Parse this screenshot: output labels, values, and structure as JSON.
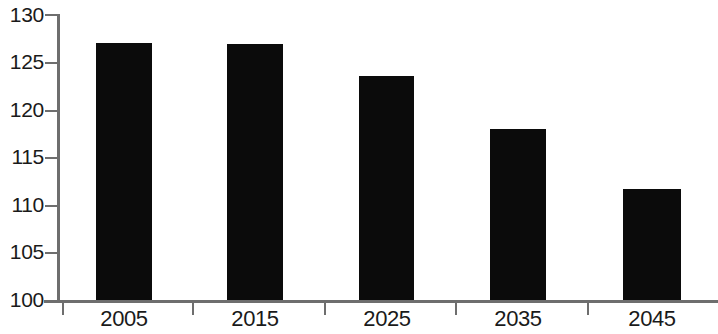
{
  "chart_data": {
    "type": "bar",
    "title": "",
    "subtitle": "",
    "xlabel": "",
    "ylabel": "",
    "categories": [
      "2005",
      "2015",
      "2025",
      "2035",
      "2045"
    ],
    "values": [
      127.0,
      126.9,
      123.5,
      117.9,
      111.6
    ],
    "series": [
      {
        "name": "",
        "values": [
          127.0,
          126.9,
          123.5,
          117.9,
          111.6
        ]
      }
    ],
    "ylim": [
      100,
      130
    ],
    "xlim": [
      0,
      5
    ],
    "y_ticks": [
      100,
      105,
      110,
      115,
      120,
      125,
      130
    ],
    "y_tick_labels": [
      "100",
      "105",
      "110",
      "115",
      "120",
      "125",
      "130"
    ],
    "x_tick_labels": [
      "2005",
      "2015",
      "2025",
      "2035",
      "2045"
    ],
    "grid": false,
    "legend": null,
    "legend_position": "none",
    "annotations": [],
    "colors": {
      "bar": "#0b0b0b",
      "axis": "#6e6e6e",
      "text": "#1a1a1a",
      "background": "#ffffff"
    }
  }
}
